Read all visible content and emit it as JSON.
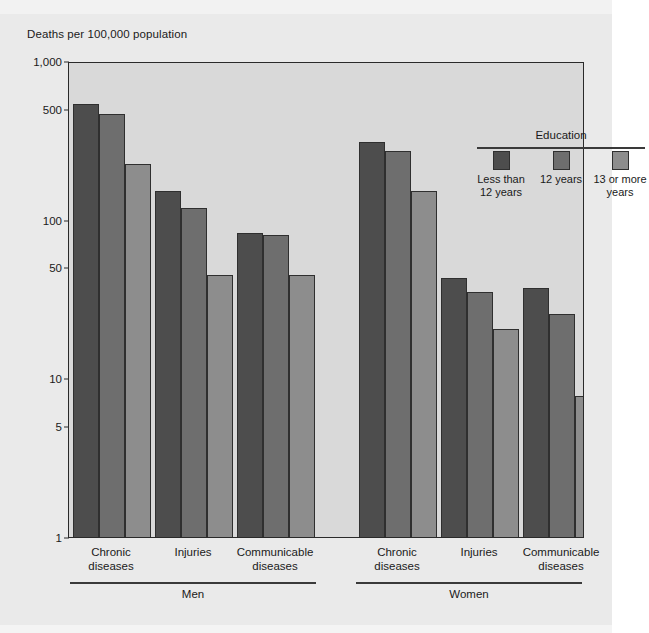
{
  "figure": {
    "axis_title": "Deaths per 100,000 population",
    "background_color": "#eaeaea",
    "plot_background_color": "#d9d9d9",
    "frame_color": "#2a2a2a"
  },
  "legend": {
    "title": "Education",
    "position": "inside-top-right",
    "items": [
      {
        "label": "Less than 12 years",
        "color": "#4d4d4d"
      },
      {
        "label": "12 years",
        "color": "#6e6e6e"
      },
      {
        "label": "13 or more years",
        "color": "#8d8d8d"
      }
    ]
  },
  "chart_data": {
    "type": "bar",
    "title": "",
    "subtitle": "",
    "xlabel": "",
    "ylabel": "Deaths per 100,000 population",
    "yscale": "log",
    "ylim": [
      1,
      1000
    ],
    "ytick_labels": [
      "1,000",
      "500",
      "100",
      "50",
      "10",
      "5",
      "1"
    ],
    "ytick_values": [
      1000,
      500,
      100,
      50,
      10,
      5,
      1
    ],
    "grid": false,
    "legend_position": "inside-top-right",
    "group_labels": [
      "Men",
      "Women"
    ],
    "categories": [
      "Chronic diseases",
      "Injuries",
      "Communicable diseases",
      "Chronic diseases",
      "Injuries",
      "Communicable diseases"
    ],
    "series": [
      {
        "name": "Less than 12 years",
        "color": "#4d4d4d",
        "values": [
          550,
          155,
          85,
          320,
          44,
          38
        ]
      },
      {
        "name": "12 years",
        "color": "#6e6e6e",
        "values": [
          480,
          122,
          83,
          280,
          36,
          26
        ]
      },
      {
        "name": "13 or more years",
        "color": "#8d8d8d",
        "values": [
          230,
          46,
          46,
          155,
          21,
          8
        ]
      }
    ],
    "panels": [
      {
        "group": "Men",
        "categories": [
          "Chronic diseases",
          "Injuries",
          "Communicable diseases"
        ],
        "series": [
          {
            "name": "Less than 12 years",
            "values": [
              550,
              155,
              85
            ]
          },
          {
            "name": "12 years",
            "values": [
              480,
              122,
              83
            ]
          },
          {
            "name": "13 or more years",
            "values": [
              230,
              46,
              46
            ]
          }
        ]
      },
      {
        "group": "Women",
        "categories": [
          "Chronic diseases",
          "Injuries",
          "Communicable diseases"
        ],
        "series": [
          {
            "name": "Less than 12 years",
            "values": [
              320,
              44,
              38
            ]
          },
          {
            "name": "12 years",
            "values": [
              280,
              36,
              26
            ]
          },
          {
            "name": "13 or more years",
            "values": [
              155,
              21,
              8
            ]
          }
        ]
      }
    ]
  },
  "x_axis": {
    "category_labels": [
      {
        "line1": "Chronic",
        "line2": "diseases"
      },
      {
        "line1": "Injuries",
        "line2": ""
      },
      {
        "line1": "Communicable",
        "line2": "diseases"
      },
      {
        "line1": "Chronic",
        "line2": "diseases"
      },
      {
        "line1": "Injuries",
        "line2": ""
      },
      {
        "line1": "Communicable",
        "line2": "diseases"
      }
    ],
    "groups": [
      "Men",
      "Women"
    ]
  }
}
